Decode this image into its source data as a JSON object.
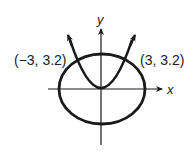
{
  "diagram": {
    "type": "coordinate-graph",
    "axes": {
      "x_label": "x",
      "y_label": "y"
    },
    "curves": [
      {
        "name": "ellipse",
        "kind": "ellipse",
        "center": [
          0,
          0
        ]
      },
      {
        "name": "parabola",
        "kind": "parabola",
        "vertex": [
          0,
          0
        ],
        "opens": "up"
      }
    ],
    "intersection_points": [
      {
        "label": "(−3, 3.2)",
        "x": -3,
        "y": 3.2
      },
      {
        "label": "(3, 3.2)",
        "x": 3,
        "y": 3.2
      }
    ],
    "colors": {
      "stroke": "#1a1a1a",
      "background": "#ffffff"
    }
  }
}
